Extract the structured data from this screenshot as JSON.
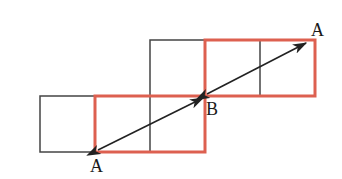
{
  "figure": {
    "width": 342,
    "height": 179,
    "background_color": "#ffffff"
  },
  "colors": {
    "red_outline": "#dd6050",
    "black_outline": "#444444",
    "arrow": "#222222",
    "label_text": "#1a1a1a"
  },
  "strokes": {
    "red_width": 3,
    "black_width": 1.5,
    "arrow_width": 1.6
  },
  "grid": {
    "cell_size": 55,
    "origin_x": 40,
    "rows": [
      {
        "name": "bottom-row",
        "top": 96,
        "bottom": 152,
        "cells": [
          {
            "name": "bottom-cell-1",
            "x0": 40,
            "x1": 95,
            "color": "black"
          },
          {
            "name": "bottom-cell-2",
            "x0": 95,
            "x1": 150,
            "color": "red"
          },
          {
            "name": "bottom-cell-3",
            "x0": 150,
            "x1": 205,
            "color": "red"
          }
        ]
      },
      {
        "name": "top-row",
        "top": 40,
        "bottom": 96,
        "cells": [
          {
            "name": "top-cell-1",
            "x0": 150,
            "x1": 205,
            "color": "black"
          },
          {
            "name": "top-cell-2",
            "x0": 205,
            "x1": 260,
            "color": "red"
          },
          {
            "name": "top-cell-3",
            "x0": 260,
            "x1": 315,
            "color": "red"
          }
        ]
      }
    ]
  },
  "shapes": {
    "black_square_lower_left": {
      "x": 40,
      "y": 96,
      "w": 55,
      "h": 56
    },
    "black_square_middle": {
      "x": 150,
      "y": 40,
      "w": 55,
      "h": 56
    },
    "red_rect_lower": {
      "x": 95,
      "y": 96,
      "w": 110,
      "h": 56,
      "divider_x": 150
    },
    "red_rect_upper": {
      "x": 205,
      "y": 40,
      "w": 110,
      "h": 56,
      "divider_x": 260
    }
  },
  "arrows": [
    {
      "name": "arrow-a-to-b",
      "from": {
        "x": 98,
        "y": 150,
        "label": "A"
      },
      "to": {
        "x": 203,
        "y": 98,
        "label": "B"
      },
      "double_headed": true
    },
    {
      "name": "arrow-b-to-a",
      "from": {
        "x": 207,
        "y": 94,
        "label": "B"
      },
      "to": {
        "x": 306,
        "y": 43,
        "label": "A"
      },
      "double_headed": true
    }
  ],
  "labels": [
    {
      "name": "label-a-bottom",
      "text": "A",
      "x": 90,
      "y": 172
    },
    {
      "name": "label-b-center",
      "text": "B",
      "x": 206,
      "y": 115
    },
    {
      "name": "label-a-top",
      "text": "A",
      "x": 311,
      "y": 36
    }
  ]
}
